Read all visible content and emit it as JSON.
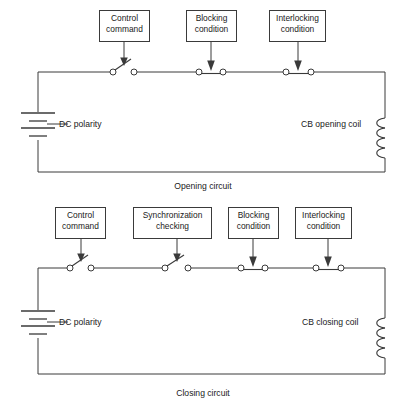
{
  "diagram": {
    "background_color": "#ffffff",
    "line_color": "#3a3a3a",
    "circuits": [
      {
        "id": "opening-circuit",
        "caption": "Opening circuit",
        "source_label": "DC polarity",
        "coil_label": "CB opening coil",
        "contacts": [
          {
            "label_line1": "Control",
            "label_line2": "command",
            "type": "open"
          },
          {
            "label_line1": "Blocking",
            "label_line2": "condition",
            "type": "closed"
          },
          {
            "label_line1": "Interlocking",
            "label_line2": "condition",
            "type": "closed"
          }
        ]
      },
      {
        "id": "closing-circuit",
        "caption": "Closing circuit",
        "source_label": "DC polarity",
        "coil_label": "CB closing coil",
        "contacts": [
          {
            "label_line1": "Control",
            "label_line2": "command",
            "type": "open"
          },
          {
            "label_line1": "Synchronization",
            "label_line2": "checking",
            "type": "open"
          },
          {
            "label_line1": "Blocking",
            "label_line2": "condition",
            "type": "closed"
          },
          {
            "label_line1": "Interlocking",
            "label_line2": "condition",
            "type": "closed"
          }
        ]
      }
    ]
  }
}
